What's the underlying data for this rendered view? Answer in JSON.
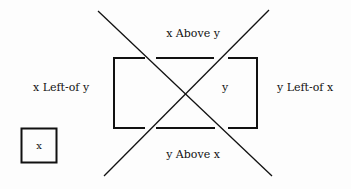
{
  "diagram": {
    "type": "spatial-relations",
    "labels": {
      "x_above_y": "x Above y",
      "y_above_x": "y Above x",
      "x_left_of_y": "x Left-of y",
      "y_left_of_x": "y Left-of x",
      "box_y": "y",
      "box_x": "x"
    },
    "colors": {
      "stroke": "#111111",
      "background": "#fdfdfd"
    }
  }
}
